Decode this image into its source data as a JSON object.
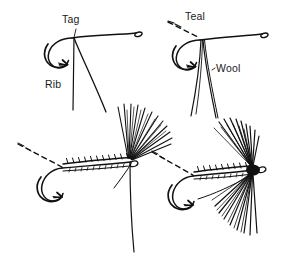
{
  "figure": {
    "background_color": "#ffffff",
    "ink_color": "#111111",
    "style": "pen and ink line drawing"
  },
  "labels": {
    "tag": "Tag",
    "rib": "Rib",
    "teal": "Teal",
    "wool": "Wool"
  },
  "panels": [
    {
      "id": "top-left",
      "name": "step-1-tag-and-rib",
      "labels": [
        "Tag",
        "Rib"
      ],
      "elements": [
        "hook",
        "hook-eye",
        "hook-bend",
        "hook-point",
        "tying-arrow",
        "tag-thread",
        "rib-thread"
      ]
    },
    {
      "id": "top-right",
      "name": "step-2-teal-and-wool",
      "labels": [
        "Teal",
        "Wool"
      ],
      "elements": [
        "hook",
        "hook-eye",
        "hook-bend",
        "hook-point",
        "tying-arrow",
        "dashed-thread",
        "teal-fibers",
        "wool-strands"
      ]
    },
    {
      "id": "bottom-left",
      "name": "step-3-ribbed-body-and-wing",
      "labels": [],
      "elements": [
        "hook",
        "hook-eye",
        "hook-bend",
        "hook-point",
        "tying-arrow",
        "dashed-thread",
        "ribbed-body",
        "wing-fibers"
      ]
    },
    {
      "id": "bottom-right",
      "name": "step-4-finished-fly",
      "labels": [],
      "elements": [
        "hook",
        "hook-eye",
        "hook-bend",
        "hook-point",
        "tying-arrow",
        "dashed-thread",
        "ribbed-body",
        "wing-fibers",
        "hackle-fibers",
        "head-knot"
      ]
    }
  ]
}
